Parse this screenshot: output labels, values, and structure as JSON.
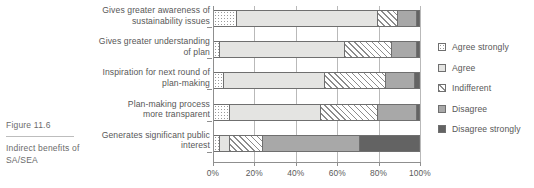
{
  "caption": {
    "figure_number": "Figure 11.6",
    "description": "Indirect benefits of SA/SEA"
  },
  "legend": {
    "position": "right",
    "items": [
      {
        "label": "Agree strongly",
        "key": "agree_strongly",
        "fill": "dotted",
        "color": "#ffffff"
      },
      {
        "label": "Agree",
        "key": "agree",
        "fill": "solid",
        "color": "#e4e4e2"
      },
      {
        "label": "Indifferent",
        "key": "indifferent",
        "fill": "hatched",
        "color": "#ffffff"
      },
      {
        "label": "Disagree",
        "key": "disagree",
        "fill": "solid",
        "color": "#a8a8a8"
      },
      {
        "label": "Disagree strongly",
        "key": "disagree_strongly",
        "fill": "solid",
        "color": "#636363"
      }
    ]
  },
  "axis": {
    "ticklabels": [
      "0%",
      "20%",
      "40%",
      "60%",
      "80%",
      "100%"
    ],
    "tickvalues": [
      0,
      20,
      40,
      60,
      80,
      100
    ]
  },
  "chart_data": {
    "type": "bar",
    "orientation": "horizontal",
    "stacked": true,
    "stack_total": 100,
    "title": "",
    "xlabel": "",
    "ylabel": "",
    "xlim": [
      0,
      100
    ],
    "grid": true,
    "legend_position": "right",
    "categories": [
      "Gives greater awareness of sustainability issues",
      "Gives greater understanding of plan",
      "Inspiration for next round of plan-making",
      "Plan-making process more transparent",
      "Generates significant public interest"
    ],
    "category_lines": [
      [
        "Gives greater awareness of",
        "sustainability issues"
      ],
      [
        "Gives greater understanding",
        "of plan"
      ],
      [
        "Inspiration for next round of",
        "plan-making"
      ],
      [
        "Plan-making process",
        "more transparent"
      ],
      [
        "Generates significant public",
        "interest"
      ]
    ],
    "series": [
      {
        "name": "Agree strongly",
        "values": [
          11,
          3,
          5,
          8,
          3
        ]
      },
      {
        "name": "Agree",
        "values": [
          69,
          61,
          49,
          44,
          5
        ]
      },
      {
        "name": "Indifferent",
        "values": [
          10,
          23,
          30,
          28,
          16
        ]
      },
      {
        "name": "Disagree",
        "values": [
          9,
          12,
          14,
          19,
          47
        ]
      },
      {
        "name": "Disagree strongly",
        "values": [
          1,
          1,
          2,
          1,
          29
        ]
      }
    ],
    "units": "percent"
  }
}
